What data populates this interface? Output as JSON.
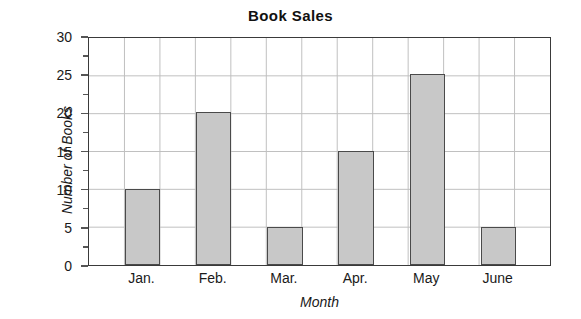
{
  "chart_data": {
    "type": "bar",
    "title": "Book Sales",
    "xlabel": "Month",
    "ylabel": "Number of Books",
    "categories": [
      "Jan.",
      "Feb.",
      "Mar.",
      "Apr.",
      "May",
      "June"
    ],
    "values": [
      10,
      20,
      5,
      15,
      25,
      5
    ],
    "ylim": [
      0,
      30
    ],
    "ytick_labels": [
      "0",
      "5",
      "10",
      "15",
      "20",
      "25",
      "30"
    ],
    "ytick_values": [
      0,
      5,
      10,
      15,
      20,
      25,
      30
    ],
    "yminor_values": [
      2.5,
      7.5,
      12.5,
      17.5,
      22.5,
      27.5
    ],
    "grid": "horizontal-and-vertical",
    "legend": "none",
    "bar_color": "#c8c8c8",
    "bar_border_color": "#4a4a4a",
    "grid_color": "#bfbfbf",
    "axis_color": "#3a3a3a",
    "background": "#ffffff"
  }
}
